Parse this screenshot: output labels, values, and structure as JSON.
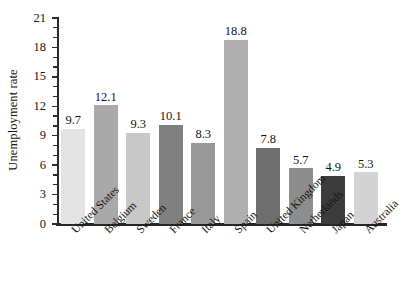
{
  "chart_data": {
    "type": "bar",
    "title": "",
    "subtitle": "",
    "xlabel": "",
    "ylabel": "Unemployment rate",
    "ylim": [
      0,
      21
    ],
    "y_major_ticks": [
      0,
      3,
      6,
      9,
      12,
      15,
      18,
      21
    ],
    "y_minor_tick_interval": 1,
    "y_tick_labels": [
      "0",
      "3",
      "6",
      "9",
      "12",
      "15",
      "18",
      "21"
    ],
    "grid": false,
    "legend": false,
    "legend_position": "none",
    "label_rotation_deg": -45,
    "categories": [
      "United States",
      "Belgium",
      "Sweden",
      "France",
      "Italy",
      "Spain",
      "United Kingdom",
      "Netherlands",
      "Japan",
      "Australia"
    ],
    "values": [
      9.7,
      12.1,
      9.3,
      10.1,
      8.3,
      18.8,
      7.8,
      5.7,
      4.9,
      5.3
    ],
    "value_labels": [
      "9.7",
      "12.1",
      "9.3",
      "10.1",
      "8.3",
      "18.8",
      "7.8",
      "5.7",
      "4.9",
      "5.3"
    ],
    "bar_colors": [
      "#e3e3e3",
      "#a9a9a9",
      "#c8c8c8",
      "#808080",
      "#989898",
      "#b0b0b0",
      "#6e6e6e",
      "#8d8d8d",
      "#3c3c3c",
      "#d3d3d3"
    ],
    "axis_color": "#262626",
    "text_color": "#141414",
    "background_color": "#ffffff"
  }
}
